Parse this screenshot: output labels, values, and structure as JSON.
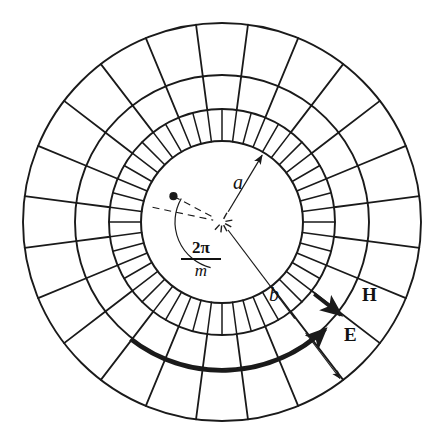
{
  "figure": {
    "background_color": "#ffffff",
    "stroke_color": "#1a1a1a",
    "width": 434,
    "height": 446
  },
  "labels": {
    "inner_radius": "a",
    "outer_radius": "b",
    "electric_field": "E",
    "magnetic_field": "H",
    "angle_numerator": "2π",
    "angle_denominator": "m"
  },
  "icons": {
    "center": "center-cross-icon",
    "node": "node-dot-icon",
    "radius_a_arrow": "radius-a-arrow-icon",
    "radius_b_arrow": "radius-b-arrow-icon",
    "angle_arc": "angle-arc-icon",
    "e_arrow": "e-field-arrow-icon",
    "h_arrow": "h-field-arrow-icon"
  },
  "geometry": {
    "center_x": 222,
    "center_y": 222,
    "radius_a": 81,
    "radius_ring1": 113,
    "radius_ring2": 147,
    "radius_b": 199,
    "inner_band_sectors": 48,
    "outer_band_sectors": 24,
    "mesh_rings": [
      81,
      113,
      147,
      199
    ],
    "angle_offset_deg": -7.5,
    "node_angle_deg": 208,
    "node_radius": 55,
    "b_line_angle_deg": 53,
    "a_arrow_angle_deg": -59
  },
  "chart_data": {
    "type": "diagram",
    "rings": [
      {
        "name": "inner-circle-a",
        "radius": 81,
        "label": "a"
      },
      {
        "name": "mesh-ring-1",
        "radius": 113,
        "label": ""
      },
      {
        "name": "mesh-ring-2",
        "radius": 147,
        "label": ""
      },
      {
        "name": "outer-circle-b",
        "radius": 199,
        "label": "b"
      }
    ],
    "bands": [
      {
        "name": "band-inner",
        "from": 81,
        "to": 113,
        "sectors": 48
      },
      {
        "name": "band-middle",
        "from": 113,
        "to": 147,
        "sectors": 24
      },
      {
        "name": "band-outer",
        "from": 147,
        "to": 199,
        "sectors": 24
      }
    ],
    "annotations": [
      {
        "name": "radius-a",
        "label": "a",
        "type": "arrow",
        "from_radius": 0,
        "to_radius": 81
      },
      {
        "name": "radius-b",
        "label": "b",
        "type": "arrow",
        "from_radius": 0,
        "to_radius": 199
      },
      {
        "name": "sector-angle",
        "label": "2π/m",
        "type": "arc-angle"
      },
      {
        "name": "e-field",
        "label": "E",
        "type": "tangential-arrow"
      },
      {
        "name": "h-field",
        "label": "H",
        "type": "radial-arrow"
      }
    ]
  }
}
